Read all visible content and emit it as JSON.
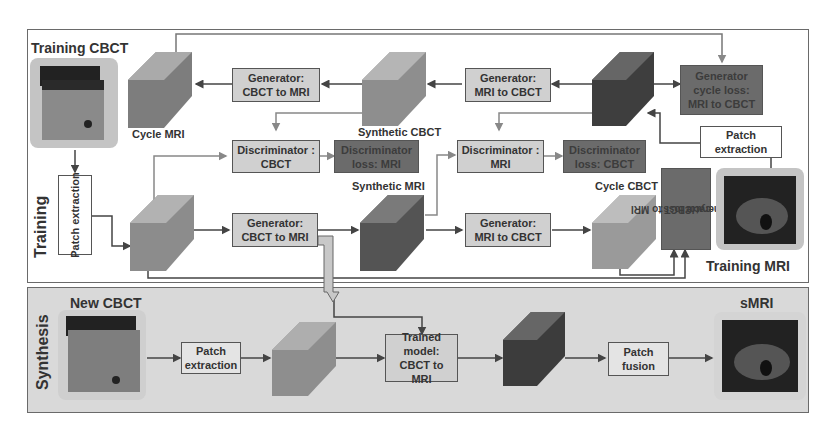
{
  "sections": {
    "training": {
      "label": "Training"
    },
    "synthesis": {
      "label": "Synthesis"
    }
  },
  "training": {
    "inputs": {
      "cbct_label": "Training CBCT",
      "mri_label": "Training MRI"
    },
    "patch_extraction_cbct": "Patch extraction",
    "patch_extraction_mri": "Patch extraction",
    "volumes": {
      "cycle_mri": "Cycle MRI",
      "synthetic_cbct": "Synthetic CBCT",
      "synthetic_mri": "Synthetic MRI",
      "cycle_cbct": "Cycle CBCT"
    },
    "generators": {
      "top_cbct_to_mri": {
        "line1": "Generator:",
        "line2": "CBCT to MRI"
      },
      "top_mri_to_cbct": {
        "line1": "Generator:",
        "line2": "MRI to CBCT"
      },
      "bottom_cbct_to_mri": {
        "line1": "Generator:",
        "line2": "CBCT to MRI"
      },
      "bottom_mri_to_cbct": {
        "line1": "Generator:",
        "line2": "MRI to CBCT"
      }
    },
    "discriminators": {
      "cbct": {
        "line1": "Discriminator :",
        "line2": "CBCT"
      },
      "mri": {
        "line1": "Discriminator :",
        "line2": "MRI"
      }
    },
    "losses": {
      "disc_loss_mri": {
        "line1": "Discriminator",
        "line2": "loss: MRI"
      },
      "disc_loss_cbct": {
        "line1": "Discriminator",
        "line2": "loss: CBCT"
      },
      "gen_cycle_mri_to_cbct": {
        "line1": "Generator",
        "line2": "cycle loss:",
        "line3": "MRI to CBCT"
      },
      "gen_cycle_cbct_to_mri": {
        "line1": "Generator",
        "line2": "cycle loss:",
        "line3": "CBCT to MRI"
      }
    }
  },
  "synthesis": {
    "input_label": "New CBCT",
    "patch_extraction": "Patch extraction",
    "trained_model": {
      "line1": "Trained",
      "line2": "model:",
      "line3": "CBCT to MRI"
    },
    "patch_fusion": "Patch fusion",
    "output_label": "sMRI"
  },
  "colors": {
    "light_box": "#d0d0d0",
    "dark_box": "#6b6b6b",
    "synthesis_bg": "#d9d9d9",
    "border": "#555555"
  }
}
